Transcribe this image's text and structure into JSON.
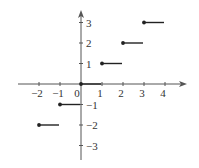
{
  "chart_data": {
    "type": "line",
    "title": "",
    "xlabel": "",
    "ylabel": "",
    "xlim": [
      -3,
      4.8
    ],
    "ylim": [
      -3.6,
      3.8
    ],
    "grid": false,
    "legend": null,
    "x_ticks": [
      -2,
      -1,
      0,
      1,
      2,
      3,
      4
    ],
    "x_tick_labels": [
      "−2",
      "−1",
      "0",
      "1",
      "2",
      "3",
      "4"
    ],
    "y_ticks": [
      1,
      2,
      3,
      -1,
      -2,
      -3
    ],
    "y_tick_labels": [
      "1",
      "2",
      "3",
      "−1",
      "−2",
      "−3"
    ],
    "segments": [
      {
        "x_start": -2,
        "x_end": -1,
        "y": -2,
        "closed_left": true
      },
      {
        "x_start": -1,
        "x_end": 0,
        "y": -1,
        "closed_left": true
      },
      {
        "x_start": 0,
        "x_end": 1,
        "y": 0,
        "closed_left": true
      },
      {
        "x_start": 1,
        "x_end": 2,
        "y": 1,
        "closed_left": true
      },
      {
        "x_start": 2,
        "x_end": 3,
        "y": 2,
        "closed_left": true
      },
      {
        "x_start": 3,
        "x_end": 4,
        "y": 3,
        "closed_left": true
      }
    ]
  },
  "colors": {
    "axis": "#555555",
    "line": "#222222",
    "text": "#333333"
  }
}
